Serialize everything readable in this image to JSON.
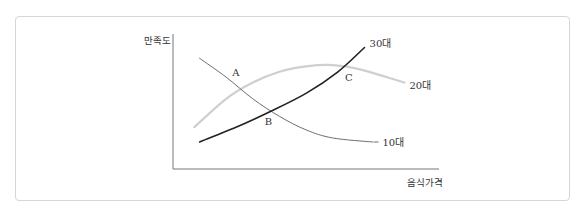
{
  "chart_data": {
    "type": "line",
    "title": "",
    "xlabel": "음식가격",
    "ylabel": "만족도",
    "grid": false,
    "legend": "inline-end-labels",
    "x_range": [
      0,
      10
    ],
    "y_range": [
      0,
      10
    ],
    "series": [
      {
        "name": "10대",
        "color": "#6e6e6e",
        "points": [
          [
            1,
            8.2
          ],
          [
            2,
            6.8
          ],
          [
            3,
            5.2
          ],
          [
            4,
            3.9
          ],
          [
            5,
            2.9
          ],
          [
            6,
            2.3
          ],
          [
            7.5,
            2.0
          ]
        ]
      },
      {
        "name": "20대",
        "color": "#cfcfcf",
        "points": [
          [
            0.8,
            3.1
          ],
          [
            2,
            5.2
          ],
          [
            3,
            6.4
          ],
          [
            4,
            7.2
          ],
          [
            5,
            7.6
          ],
          [
            6,
            7.7
          ],
          [
            7,
            7.4
          ],
          [
            8.7,
            6.4
          ]
        ]
      },
      {
        "name": "30대",
        "color": "#222222",
        "points": [
          [
            1,
            2.0
          ],
          [
            2.5,
            3.2
          ],
          [
            3.6,
            4.2
          ],
          [
            5,
            5.6
          ],
          [
            6.2,
            7.2
          ],
          [
            7.2,
            9.0
          ]
        ]
      }
    ],
    "annotations": [
      {
        "label": "A",
        "x": 2.3,
        "y": 6.6,
        "note": "intersection of 10대 and 20대"
      },
      {
        "label": "B",
        "x": 3.6,
        "y": 4.1,
        "note": "intersection of 10대 and 30대"
      },
      {
        "label": "C",
        "x": 6.5,
        "y": 7.4,
        "note": "intersection of 20대 and 30대"
      }
    ]
  }
}
